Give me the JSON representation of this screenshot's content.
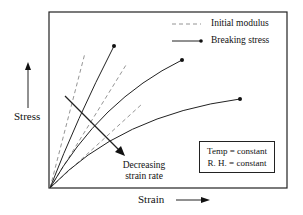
{
  "diagram": {
    "type": "stress-strain schematic",
    "axes": {
      "x_label": "Strain",
      "y_label": "Stress"
    },
    "legend": [
      {
        "style": "dashed",
        "label": "Initial modulus"
      },
      {
        "style": "solid-with-dot",
        "label": "Breaking stress"
      }
    ],
    "annotation": {
      "arrow_label_line1": "Decreasing",
      "arrow_label_line2": "strain rate"
    },
    "conditions": {
      "line1": "Temp = constant",
      "line2": "R. H. = constant"
    },
    "curves": [
      {
        "name": "fast strain rate",
        "end_point": [
          114,
          46
        ]
      },
      {
        "name": "medium strain rate",
        "end_point": [
          182,
          60
        ]
      },
      {
        "name": "slow strain rate",
        "end_point": [
          240,
          99
        ]
      }
    ],
    "colors": {
      "line": "#222222",
      "dashed": "#888888",
      "background": "#ffffff"
    }
  }
}
